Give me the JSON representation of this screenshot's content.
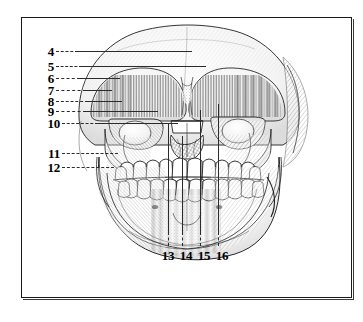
{
  "figure": {
    "type": "anatomical-engraving",
    "view": "anterior",
    "frame_color": "#1a1a1a",
    "background_color": "#ffffff",
    "ink_color": "#2b2b2b"
  },
  "callouts": {
    "left_column": [
      {
        "number": "4",
        "x": 44,
        "y": 46,
        "leader_end_x": 176,
        "leader_kind": "dash-solid"
      },
      {
        "number": "5",
        "x": 44,
        "y": 61,
        "leader_end_x": 188,
        "leader_kind": "dash-solid"
      },
      {
        "number": "6",
        "x": 44,
        "y": 73,
        "leader_end_x": 104,
        "leader_kind": "dash-solid"
      },
      {
        "number": "7",
        "x": 44,
        "y": 85,
        "leader_end_x": 96,
        "leader_kind": "dash-solid"
      },
      {
        "number": "8",
        "x": 44,
        "y": 96,
        "leader_end_x": 112,
        "leader_kind": "dash-solid"
      },
      {
        "number": "9",
        "x": 44,
        "y": 106,
        "leader_end_x": 148,
        "leader_kind": "dash-solid"
      },
      {
        "number": "10",
        "x": 47,
        "y": 118,
        "leader_end_x": 170,
        "leader_kind": "dash-solid"
      },
      {
        "number": "11",
        "x": 47,
        "y": 148,
        "leader_end_x": 108,
        "leader_kind": "dash"
      },
      {
        "number": "12",
        "x": 47,
        "y": 162,
        "leader_end_x": 104,
        "leader_kind": "dash"
      }
    ],
    "bottom_row": [
      {
        "number": "13",
        "x": 167,
        "y": 254,
        "leader_top_y": 120,
        "leader_kind": "solid-dash"
      },
      {
        "number": "14",
        "x": 185,
        "y": 254,
        "leader_top_y": 132,
        "leader_kind": "solid-dash"
      },
      {
        "number": "15",
        "x": 203,
        "y": 254,
        "leader_top_y": 106,
        "leader_kind": "solid-dash"
      },
      {
        "number": "16",
        "x": 221,
        "y": 254,
        "leader_top_y": 100,
        "leader_kind": "solid-dash"
      }
    ]
  }
}
